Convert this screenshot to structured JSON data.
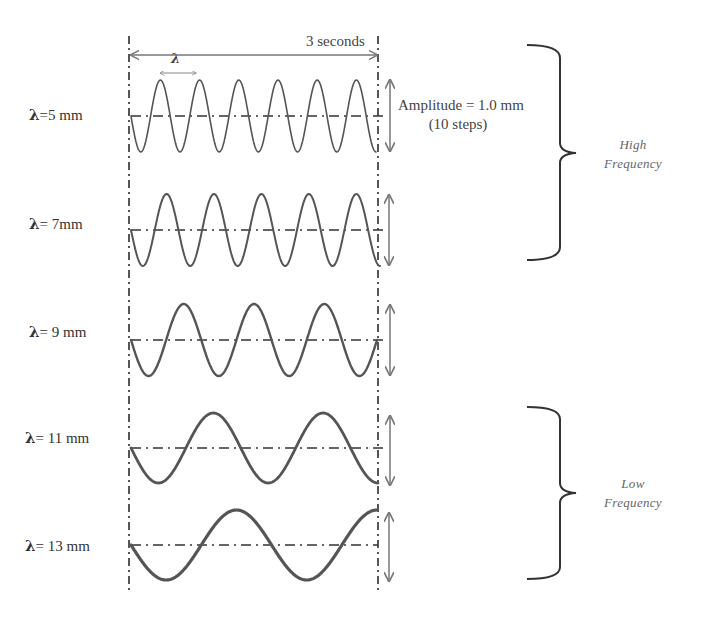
{
  "diagram": {
    "time_span_label": "3 seconds",
    "wavelength_symbol": "λ",
    "amplitude": {
      "line1": "Amplitude = 1.0 mm",
      "line2": "(10 steps)"
    },
    "rows": [
      {
        "symbol": "λ",
        "label": "=5 mm",
        "wavelength_mm": 5,
        "cycles": 6.25
      },
      {
        "symbol": "λ",
        "label": "= 7mm",
        "wavelength_mm": 7,
        "cycles": 5.25
      },
      {
        "symbol": "λ",
        "label": "= 9 mm",
        "wavelength_mm": 9,
        "cycles": 3.5
      },
      {
        "symbol": "λ",
        "label": "= 11 mm",
        "wavelength_mm": 11,
        "cycles": 2.25
      },
      {
        "symbol": "λ",
        "label": "= 13 mm",
        "wavelength_mm": 13,
        "cycles": 1.75
      }
    ],
    "groups": [
      {
        "line1": "High",
        "line2": "Frequency",
        "rows": [
          0,
          1
        ]
      },
      {
        "line1": "Low",
        "line2": "Frequency",
        "rows": [
          3,
          4
        ]
      }
    ],
    "colors": {
      "wave": "#555555",
      "guide": "#444444",
      "arrow": "#777777",
      "brace": "#333333"
    }
  }
}
